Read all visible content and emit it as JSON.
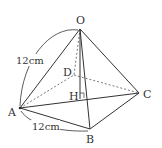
{
  "diagram": {
    "type": "square pyramid",
    "vertices": {
      "O": {
        "label": "O",
        "x": 80,
        "y": 29
      },
      "A": {
        "label": "A",
        "x": 20,
        "y": 108
      },
      "B": {
        "label": "B",
        "x": 90,
        "y": 129
      },
      "C": {
        "label": "C",
        "x": 139,
        "y": 93
      },
      "D": {
        "label": "D",
        "x": 74,
        "y": 75
      },
      "H": {
        "label": "H",
        "x": 80,
        "y": 99
      }
    },
    "dimensions": {
      "edge_OA": "12cm",
      "edge_AB": "12cm"
    },
    "colors": {
      "line": "#333333",
      "background": "#ffffff"
    }
  }
}
